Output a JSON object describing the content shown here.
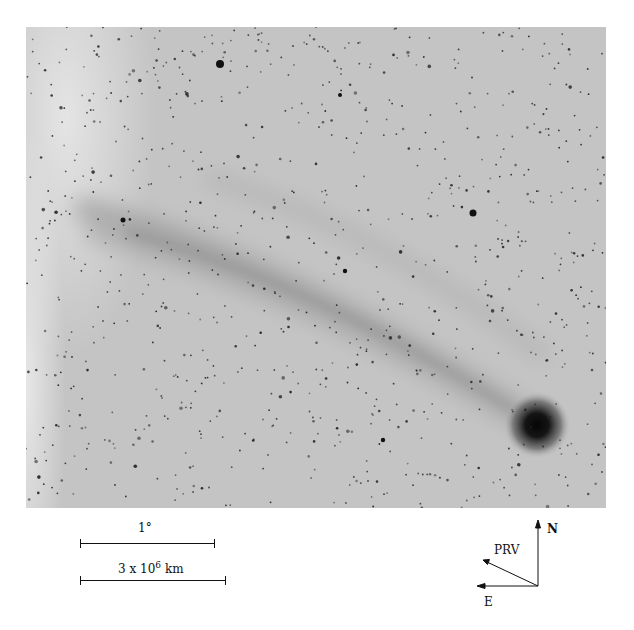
{
  "figure": {
    "image_tone": "negative grayscale",
    "colors": {
      "background": "#c4c4c4",
      "stars": "#1a1a1a",
      "coma": "#0d0d0d",
      "tail": "#9a9a9a"
    }
  },
  "scale_bars": [
    {
      "label": "1°",
      "length_px": 135
    },
    {
      "label_base": "3 x 10",
      "label_exp": "6",
      "label_unit": "km",
      "length_px": 146
    }
  ],
  "compass": {
    "north": "N",
    "east": "E",
    "prv": "PRV"
  }
}
